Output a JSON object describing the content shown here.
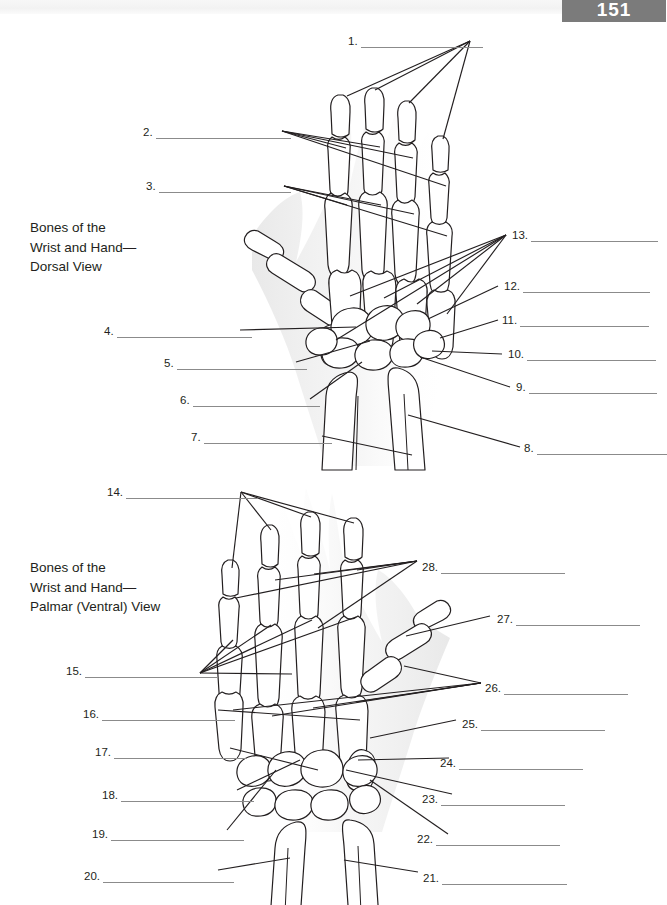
{
  "page": {
    "tab_label": "151",
    "background": "#ffffff",
    "tab_color": "#7b7b7b",
    "rule_color": "#8b8b8b",
    "ink_color": "#231f20"
  },
  "figures": [
    {
      "id": "dorsal",
      "caption": "Bones of the\nWrist and Hand—\nDorsal View",
      "caption_x": 30,
      "caption_y": 218
    },
    {
      "id": "palmar",
      "caption": "Bones of the\nWrist and Hand—\nPalmar (Ventral) View",
      "caption_x": 30,
      "caption_y": 558
    }
  ],
  "labels": [
    {
      "num": "1.",
      "x": 348,
      "y": 35,
      "rule": 122,
      "figure": "dorsal",
      "align": "left"
    },
    {
      "num": "2.",
      "x": 143,
      "y": 126,
      "rule": 135,
      "figure": "dorsal",
      "align": "left"
    },
    {
      "num": "3.",
      "x": 146,
      "y": 180,
      "rule": 132,
      "figure": "dorsal",
      "align": "left"
    },
    {
      "num": "4.",
      "x": 104,
      "y": 325,
      "rule": 135,
      "figure": "dorsal",
      "align": "left"
    },
    {
      "num": "5.",
      "x": 164,
      "y": 357,
      "rule": 130,
      "figure": "dorsal",
      "align": "left"
    },
    {
      "num": "6.",
      "x": 180,
      "y": 394,
      "rule": 127,
      "figure": "dorsal",
      "align": "left"
    },
    {
      "num": "7.",
      "x": 191,
      "y": 431,
      "rule": 128,
      "figure": "dorsal",
      "align": "left"
    },
    {
      "num": "8.",
      "x": 524,
      "y": 442,
      "rule": 130,
      "figure": "dorsal",
      "align": "left"
    },
    {
      "num": "9.",
      "x": 516,
      "y": 381,
      "rule": 128,
      "figure": "dorsal",
      "align": "left"
    },
    {
      "num": "10.",
      "x": 508,
      "y": 348,
      "rule": 129,
      "figure": "dorsal",
      "align": "left"
    },
    {
      "num": "11.",
      "x": 502,
      "y": 314,
      "rule": 129,
      "figure": "dorsal",
      "align": "left"
    },
    {
      "num": "12.",
      "x": 504,
      "y": 280,
      "rule": 127,
      "figure": "dorsal",
      "align": "left"
    },
    {
      "num": "13.",
      "x": 512,
      "y": 229,
      "rule": 127,
      "figure": "dorsal",
      "align": "left"
    },
    {
      "num": "14.",
      "x": 107,
      "y": 486,
      "rule": 132,
      "figure": "palmar",
      "align": "left"
    },
    {
      "num": "15.",
      "x": 66,
      "y": 665,
      "rule": 132,
      "figure": "palmar",
      "align": "left"
    },
    {
      "num": "16.",
      "x": 83,
      "y": 708,
      "rule": 133,
      "figure": "palmar",
      "align": "left"
    },
    {
      "num": "17.",
      "x": 95,
      "y": 746,
      "rule": 133,
      "figure": "palmar",
      "align": "left"
    },
    {
      "num": "18.",
      "x": 102,
      "y": 789,
      "rule": 133,
      "figure": "palmar",
      "align": "left"
    },
    {
      "num": "19.",
      "x": 92,
      "y": 828,
      "rule": 133,
      "figure": "palmar",
      "align": "left"
    },
    {
      "num": "20.",
      "x": 84,
      "y": 870,
      "rule": 131,
      "figure": "palmar",
      "align": "left"
    },
    {
      "num": "21.",
      "x": 423,
      "y": 872,
      "rule": 125,
      "figure": "palmar",
      "align": "left"
    },
    {
      "num": "22.",
      "x": 417,
      "y": 833,
      "rule": 124,
      "figure": "palmar",
      "align": "left"
    },
    {
      "num": "23.",
      "x": 422,
      "y": 793,
      "rule": 124,
      "figure": "palmar",
      "align": "left"
    },
    {
      "num": "24.",
      "x": 440,
      "y": 757,
      "rule": 124,
      "figure": "palmar",
      "align": "left"
    },
    {
      "num": "25.",
      "x": 462,
      "y": 718,
      "rule": 124,
      "figure": "palmar",
      "align": "left"
    },
    {
      "num": "26.",
      "x": 485,
      "y": 682,
      "rule": 124,
      "figure": "palmar",
      "align": "left"
    },
    {
      "num": "27.",
      "x": 497,
      "y": 613,
      "rule": 124,
      "figure": "palmar",
      "align": "left"
    },
    {
      "num": "28.",
      "x": 422,
      "y": 561,
      "rule": 124,
      "figure": "palmar",
      "align": "left"
    }
  ],
  "illustrations": {
    "dorsal_view": "hand-skeleton-dorsal",
    "palmar_view": "hand-skeleton-palmar"
  }
}
